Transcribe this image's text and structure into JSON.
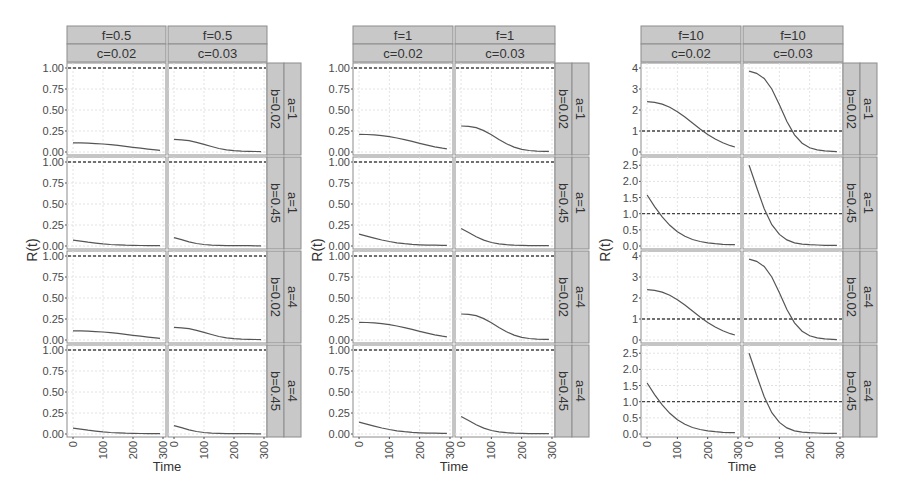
{
  "chart_data": [
    {
      "type": "line",
      "title": "",
      "xlabel": "Time",
      "ylabel": "R(t)",
      "facet_cols": [
        {
          "f": "f=0.5",
          "c": "c=0.02"
        },
        {
          "f": "f=0.5",
          "c": "c=0.03"
        }
      ],
      "facet_rows": [
        {
          "a": "a=1",
          "b": "b=0.02"
        },
        {
          "a": "a=1",
          "b": "b=0.45"
        },
        {
          "a": "a=4",
          "b": "b=0.02"
        },
        {
          "a": "a=4",
          "b": "b=0.45"
        }
      ],
      "x_ticks": [
        0,
        100,
        200,
        300
      ],
      "xlim": [
        -20,
        310
      ],
      "row_ylim": [
        [
          0,
          1.0
        ],
        [
          0,
          1.0
        ],
        [
          0,
          1.0
        ],
        [
          0,
          1.0
        ]
      ],
      "row_yticks": [
        [
          "0.00",
          "0.25",
          "0.50",
          "0.75",
          "1.00"
        ],
        [
          "0.00",
          "0.25",
          "0.50",
          "0.75",
          "1.00"
        ],
        [
          "0.00",
          "0.25",
          "0.50",
          "0.75",
          "1.00"
        ],
        [
          "0.00",
          "0.25",
          "0.50",
          "0.75",
          "1.00"
        ]
      ],
      "reference_line": 1.0,
      "x": [
        0,
        25,
        50,
        75,
        100,
        125,
        150,
        175,
        200,
        225,
        250,
        275,
        290
      ],
      "series": [
        {
          "row": 0,
          "col": 0,
          "values": [
            0.11,
            0.11,
            0.105,
            0.1,
            0.095,
            0.088,
            0.078,
            0.068,
            0.056,
            0.045,
            0.035,
            0.025,
            0.02
          ]
        },
        {
          "row": 0,
          "col": 1,
          "values": [
            0.15,
            0.145,
            0.135,
            0.115,
            0.09,
            0.065,
            0.042,
            0.025,
            0.015,
            0.01,
            0.008,
            0.006,
            0.005
          ]
        },
        {
          "row": 1,
          "col": 0,
          "values": [
            0.07,
            0.058,
            0.045,
            0.034,
            0.025,
            0.018,
            0.013,
            0.01,
            0.008,
            0.006,
            0.005,
            0.004,
            0.004
          ]
        },
        {
          "row": 1,
          "col": 1,
          "values": [
            0.1,
            0.075,
            0.05,
            0.03,
            0.018,
            0.011,
            0.007,
            0.005,
            0.004,
            0.003,
            0.003,
            0.002,
            0.002
          ]
        },
        {
          "row": 2,
          "col": 0,
          "values": [
            0.11,
            0.11,
            0.105,
            0.1,
            0.095,
            0.088,
            0.078,
            0.068,
            0.056,
            0.045,
            0.035,
            0.025,
            0.02
          ]
        },
        {
          "row": 2,
          "col": 1,
          "values": [
            0.15,
            0.145,
            0.135,
            0.115,
            0.09,
            0.065,
            0.042,
            0.025,
            0.015,
            0.01,
            0.008,
            0.006,
            0.005
          ]
        },
        {
          "row": 3,
          "col": 0,
          "values": [
            0.07,
            0.058,
            0.045,
            0.034,
            0.025,
            0.018,
            0.013,
            0.01,
            0.008,
            0.006,
            0.005,
            0.004,
            0.004
          ]
        },
        {
          "row": 3,
          "col": 1,
          "values": [
            0.1,
            0.075,
            0.05,
            0.03,
            0.018,
            0.011,
            0.007,
            0.005,
            0.004,
            0.003,
            0.003,
            0.002,
            0.002
          ]
        }
      ]
    },
    {
      "type": "line",
      "title": "",
      "xlabel": "Time",
      "ylabel": "R(t)",
      "facet_cols": [
        {
          "f": "f=1",
          "c": "c=0.02"
        },
        {
          "f": "f=1",
          "c": "c=0.03"
        }
      ],
      "facet_rows": [
        {
          "a": "a=1",
          "b": "b=0.02"
        },
        {
          "a": "a=1",
          "b": "b=0.45"
        },
        {
          "a": "a=4",
          "b": "b=0.02"
        },
        {
          "a": "a=4",
          "b": "b=0.45"
        }
      ],
      "x_ticks": [
        0,
        100,
        200,
        300
      ],
      "xlim": [
        -20,
        310
      ],
      "row_ylim": [
        [
          0,
          1.0
        ],
        [
          0,
          1.0
        ],
        [
          0,
          1.0
        ],
        [
          0,
          1.0
        ]
      ],
      "row_yticks": [
        [
          "0.00",
          "0.25",
          "0.50",
          "0.75",
          "1.00"
        ],
        [
          "0.00",
          "0.25",
          "0.50",
          "0.75",
          "1.00"
        ],
        [
          "0.00",
          "0.25",
          "0.50",
          "0.75",
          "1.00"
        ],
        [
          "0.00",
          "0.25",
          "0.50",
          "0.75",
          "1.00"
        ]
      ],
      "reference_line": 1.0,
      "x": [
        0,
        25,
        50,
        75,
        100,
        125,
        150,
        175,
        200,
        225,
        250,
        275,
        290
      ],
      "series": [
        {
          "row": 0,
          "col": 0,
          "values": [
            0.21,
            0.208,
            0.203,
            0.195,
            0.183,
            0.167,
            0.148,
            0.126,
            0.103,
            0.082,
            0.062,
            0.045,
            0.037
          ]
        },
        {
          "row": 0,
          "col": 1,
          "values": [
            0.31,
            0.305,
            0.29,
            0.255,
            0.205,
            0.15,
            0.098,
            0.058,
            0.032,
            0.018,
            0.011,
            0.008,
            0.007
          ]
        },
        {
          "row": 1,
          "col": 0,
          "values": [
            0.14,
            0.118,
            0.094,
            0.072,
            0.053,
            0.038,
            0.027,
            0.019,
            0.014,
            0.011,
            0.009,
            0.008,
            0.008
          ]
        },
        {
          "row": 1,
          "col": 1,
          "values": [
            0.21,
            0.16,
            0.11,
            0.07,
            0.042,
            0.025,
            0.015,
            0.01,
            0.007,
            0.005,
            0.004,
            0.004,
            0.004
          ]
        },
        {
          "row": 2,
          "col": 0,
          "values": [
            0.21,
            0.208,
            0.203,
            0.195,
            0.183,
            0.167,
            0.148,
            0.126,
            0.103,
            0.082,
            0.062,
            0.045,
            0.037
          ]
        },
        {
          "row": 2,
          "col": 1,
          "values": [
            0.31,
            0.305,
            0.29,
            0.255,
            0.205,
            0.15,
            0.098,
            0.058,
            0.032,
            0.018,
            0.011,
            0.008,
            0.007
          ]
        },
        {
          "row": 3,
          "col": 0,
          "values": [
            0.14,
            0.118,
            0.094,
            0.072,
            0.053,
            0.038,
            0.027,
            0.019,
            0.014,
            0.011,
            0.009,
            0.008,
            0.008
          ]
        },
        {
          "row": 3,
          "col": 1,
          "values": [
            0.21,
            0.16,
            0.11,
            0.07,
            0.042,
            0.025,
            0.015,
            0.01,
            0.007,
            0.005,
            0.004,
            0.004,
            0.004
          ]
        }
      ]
    },
    {
      "type": "line",
      "title": "",
      "xlabel": "Time",
      "ylabel": "R(t)",
      "facet_cols": [
        {
          "f": "f=10",
          "c": "c=0.02"
        },
        {
          "f": "f=10",
          "c": "c=0.03"
        }
      ],
      "facet_rows": [
        {
          "a": "a=1",
          "b": "b=0.02"
        },
        {
          "a": "a=1",
          "b": "b=0.45"
        },
        {
          "a": "a=4",
          "b": "b=0.02"
        },
        {
          "a": "a=4",
          "b": "b=0.45"
        }
      ],
      "x_ticks": [
        0,
        100,
        200,
        300
      ],
      "xlim": [
        -20,
        310
      ],
      "row_ylim": [
        [
          0,
          4.0
        ],
        [
          0,
          2.6
        ],
        [
          0,
          4.0
        ],
        [
          0,
          2.6
        ]
      ],
      "row_yticks": [
        [
          "0",
          "1",
          "2",
          "3",
          "4"
        ],
        [
          "0.0",
          "0.5",
          "1.0",
          "1.5",
          "2.0",
          "2.5"
        ],
        [
          "0",
          "1",
          "2",
          "3",
          "4"
        ],
        [
          "0.0",
          "0.5",
          "1.0",
          "1.5",
          "2.0",
          "2.5"
        ]
      ],
      "reference_line": 1.0,
      "x": [
        0,
        25,
        50,
        75,
        100,
        125,
        150,
        175,
        200,
        225,
        250,
        275,
        290
      ],
      "series": [
        {
          "row": 0,
          "col": 0,
          "values": [
            2.4,
            2.36,
            2.28,
            2.13,
            1.92,
            1.66,
            1.38,
            1.1,
            0.84,
            0.62,
            0.44,
            0.3,
            0.24
          ]
        },
        {
          "row": 0,
          "col": 1,
          "values": [
            3.85,
            3.75,
            3.5,
            3.0,
            2.25,
            1.45,
            0.82,
            0.42,
            0.2,
            0.1,
            0.05,
            0.03,
            0.02
          ]
        },
        {
          "row": 1,
          "col": 0,
          "values": [
            1.58,
            1.22,
            0.9,
            0.64,
            0.44,
            0.3,
            0.2,
            0.14,
            0.1,
            0.07,
            0.05,
            0.04,
            0.04
          ]
        },
        {
          "row": 1,
          "col": 1,
          "values": [
            2.5,
            1.82,
            1.15,
            0.66,
            0.36,
            0.19,
            0.1,
            0.06,
            0.04,
            0.03,
            0.02,
            0.02,
            0.02
          ]
        },
        {
          "row": 2,
          "col": 0,
          "values": [
            2.4,
            2.36,
            2.28,
            2.13,
            1.92,
            1.66,
            1.38,
            1.1,
            0.84,
            0.62,
            0.44,
            0.3,
            0.24
          ]
        },
        {
          "row": 2,
          "col": 1,
          "values": [
            3.85,
            3.75,
            3.5,
            3.0,
            2.25,
            1.45,
            0.82,
            0.42,
            0.2,
            0.1,
            0.05,
            0.03,
            0.02
          ]
        },
        {
          "row": 3,
          "col": 0,
          "values": [
            1.58,
            1.22,
            0.9,
            0.64,
            0.44,
            0.3,
            0.2,
            0.14,
            0.1,
            0.07,
            0.05,
            0.04,
            0.04
          ]
        },
        {
          "row": 3,
          "col": 1,
          "values": [
            2.5,
            1.82,
            1.15,
            0.66,
            0.36,
            0.19,
            0.1,
            0.06,
            0.04,
            0.03,
            0.02,
            0.02,
            0.02
          ]
        }
      ]
    }
  ],
  "layout": {
    "groups": [
      {
        "panel_left": 67,
        "panel_width": 99,
        "panel_gap": 2,
        "ylabel_x": 37
      },
      {
        "panel_left": 353,
        "panel_width": 100,
        "panel_gap": 2,
        "ylabel_x": 322
      },
      {
        "panel_left": 641,
        "panel_width": 100,
        "panel_gap": 2,
        "ylabel_x": 610
      }
    ],
    "strip_top": 26,
    "strip_height": 18,
    "panel_top": 63,
    "panel_height": 92,
    "row_gap": 2,
    "right_strip_width": 17,
    "colors": {
      "strip_fill": "#c8c8c8",
      "strip_border": "#8c8c8c",
      "panel_border": "#8c8c8c",
      "grid": "#e2e2e2",
      "line": "#555555",
      "dashed": "#444444",
      "text": "#333333",
      "tick_text": "#4a4a4a"
    }
  }
}
